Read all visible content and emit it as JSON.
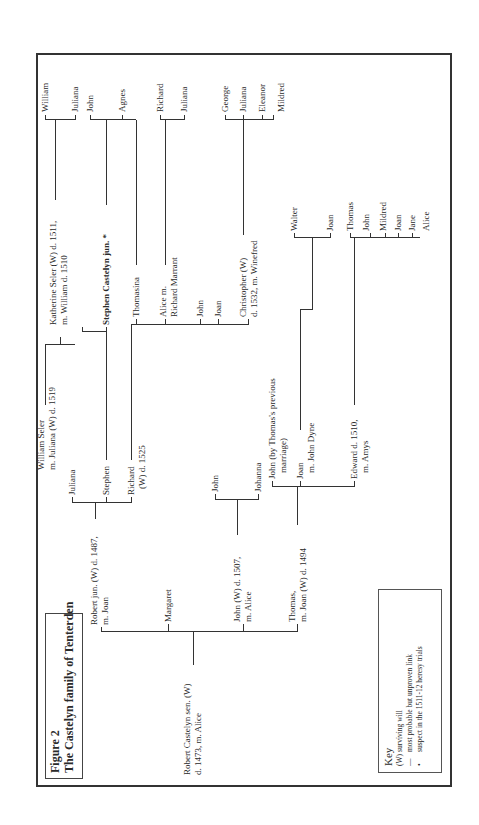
{
  "figure": {
    "label": "Figure 2",
    "title": "The Castelyn family of Tenterden"
  },
  "key": {
    "title": "Key",
    "items": [
      {
        "symbol": "(W)",
        "text": "surviving will"
      },
      {
        "symbol": "—",
        "text": "most probable but unproven link"
      },
      {
        "symbol": "•",
        "text": "suspect in the 1511-12 heresy trials"
      }
    ]
  },
  "tree": {
    "root": {
      "line1": "Robert Castelyn sen. (W)",
      "line2": "d. 1473, m. Alice"
    },
    "gen2": {
      "robert_jun": {
        "line1": "Robert jun. (W) d. 1487,",
        "line2": "m. Joan"
      },
      "margaret": "Margaret",
      "john": {
        "line1": "John (W) d. 1507,",
        "line2": "m. Alice"
      },
      "thomas": {
        "line1": "Thomas,",
        "line2": "m. Joan (W) d. 1494"
      }
    },
    "seler": {
      "line1": "William Seler",
      "line2": "m. Juliana (W) d. 1519"
    },
    "gen3": {
      "juliana": "Juliana",
      "stephen": "Stephen",
      "richard": {
        "line1": "Richard",
        "line2": "(W) d. 1525"
      },
      "john_son": "John",
      "johanna": "Johanna",
      "john_prev": {
        "line1": "John (by Thomas's previous",
        "line2": "marriage)"
      },
      "joan": {
        "line1": "Joan",
        "line2": "m. John Dyne"
      },
      "edward": {
        "line1": "Edward d. 1510,",
        "line2": "m. Amys"
      }
    },
    "gen4": {
      "katherine": {
        "line1": "Katherine Seler (W) d. 1511,",
        "line2": "m. William d. 1510"
      },
      "stephen_jun": "Stephen Castelyn jun. *",
      "thomasina": "Thomasina",
      "alice": {
        "line1": "Alice m.",
        "line2": "Richard Marrant"
      },
      "john": "John",
      "joan": "Joan",
      "christopher": {
        "line1": "Christopher (W)",
        "line2": "d. 1532, m. Winefred"
      },
      "walter": "Walter",
      "joan_dyne": "Joan",
      "thomas": "Thomas",
      "john_e": "John",
      "mildred_e": "Mildred",
      "joan_e": "Joan",
      "jane_e": "Jane",
      "alice_e": "Alice"
    },
    "gen5": {
      "william": "William",
      "juliana_k": "Juliana",
      "john_s": "John",
      "agnes": "Agnes",
      "richard_a": "Richard",
      "juliana_a": "Juliana",
      "george": "George",
      "juliana_c": "Juliana",
      "eleanor": "Eleanor",
      "mildred_c": "Mildred"
    }
  }
}
